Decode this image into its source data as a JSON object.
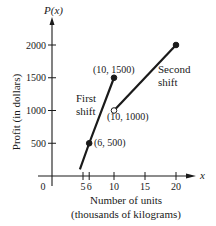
{
  "chart_data": {
    "type": "line",
    "title": "",
    "ylabel": "Profit (in dollars)",
    "y_axis_symbol": "P(x)",
    "x_axis_symbol": "x",
    "xlabel_line1": "Number of units",
    "xlabel_line2": "(thousands of kilograms)",
    "origin_label": "0",
    "x_ticks": [
      {
        "value": 5,
        "label": "5"
      },
      {
        "value": 6,
        "label": "6"
      },
      {
        "value": 10,
        "label": "10"
      },
      {
        "value": 15,
        "label": "15"
      },
      {
        "value": 20,
        "label": "20"
      }
    ],
    "y_ticks": [
      {
        "value": 500,
        "label": "500"
      },
      {
        "value": 1000,
        "label": "1000"
      },
      {
        "value": 1500,
        "label": "1500"
      },
      {
        "value": 2000,
        "label": "2000"
      }
    ],
    "xlim": [
      0,
      22
    ],
    "ylim": [
      0,
      2200
    ],
    "series": [
      {
        "name": "First shift",
        "label_line1": "First",
        "label_line2": "shift",
        "x": [
          4.5,
          6,
          10
        ],
        "y": [
          100,
          500,
          1500
        ],
        "endpoints": [
          {
            "x": 6,
            "y": 500,
            "label": "(6, 500)",
            "marker": "closed"
          },
          {
            "x": 10,
            "y": 1500,
            "label": "(10, 1500)",
            "marker": "closed"
          }
        ]
      },
      {
        "name": "Second shift",
        "label_line1": "Second",
        "label_line2": "shift",
        "x": [
          10,
          20
        ],
        "y": [
          1000,
          2000
        ],
        "endpoints": [
          {
            "x": 10,
            "y": 1000,
            "label": "(10, 1000)",
            "marker": "open"
          },
          {
            "x": 20,
            "y": 2000,
            "label": "",
            "marker": "closed"
          }
        ]
      }
    ],
    "grid": false,
    "legend": "none (inline labels)"
  }
}
